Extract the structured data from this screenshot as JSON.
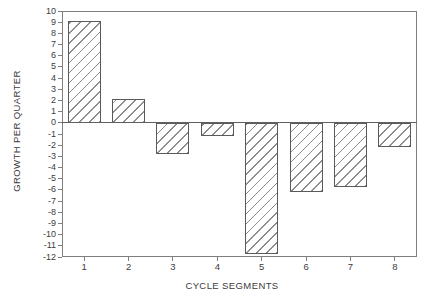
{
  "figure": {
    "background": "#ffffff"
  },
  "chart_data": {
    "type": "bar",
    "title": "",
    "xlabel": "CYCLE SEGMENTS",
    "ylabel": "GROWTH PER QUARTER",
    "categories": [
      "1",
      "2",
      "3",
      "4",
      "5",
      "6",
      "7",
      "8"
    ],
    "values": [
      9.1,
      2.1,
      -2.8,
      -1.2,
      -11.7,
      -6.2,
      -5.7,
      -2.2
    ],
    "ylim": [
      -12,
      10
    ],
    "ytick_step": 1,
    "yticks": [
      10,
      9,
      8,
      7,
      6,
      5,
      4,
      3,
      2,
      1,
      0,
      -1,
      -2,
      -3,
      -4,
      -5,
      -6,
      -7,
      -8,
      -9,
      -10,
      -11,
      -12
    ],
    "grid": false,
    "legend": false,
    "bar_fill": "diagonal-hatch-forward",
    "colors": {
      "frame": "#7f7f7f",
      "axis_text": "#3c3c3c",
      "bar_edge": "#5a5a5a",
      "hatch_line": "#8c8c8c",
      "zero_line": "#606060",
      "background": "#ffffff"
    }
  }
}
